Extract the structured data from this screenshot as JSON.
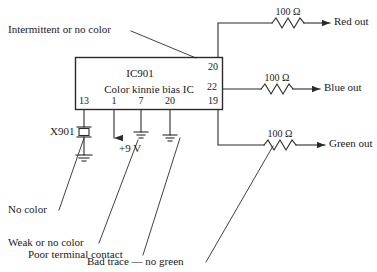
{
  "diagram": {
    "ic": {
      "name": "IC901",
      "description": "Color kinnie bias IC",
      "pins_bottom": [
        "13",
        "1",
        "7",
        "20",
        "19"
      ],
      "pins_right": [
        "20",
        "22"
      ]
    },
    "components": {
      "crystal_label": "X901",
      "supply_label": "+9 V",
      "resistor_red": "100 Ω",
      "resistor_blue": "100 Ω",
      "resistor_green": "100 Ω"
    },
    "outputs": {
      "red": "Red out",
      "blue": "Blue out",
      "green": "Green out"
    },
    "annotations": {
      "intermittent": "Intermittent or no color",
      "no_color": "No color",
      "weak": "Weak or no color",
      "poor_contact": "Poor terminal contact",
      "bad_trace": "Bad trace — no green"
    },
    "colors": {
      "line": "#2b2b2b",
      "text": "#1a1a1a",
      "background": "#ffffff"
    }
  }
}
